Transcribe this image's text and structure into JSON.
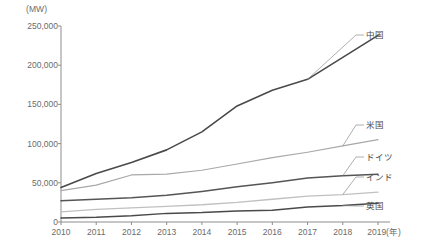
{
  "chart_data": {
    "type": "line",
    "title": "",
    "xlabel": "(年)",
    "ylabel": "(MW)",
    "unit_label": "(MW)",
    "x": [
      2010,
      2011,
      2012,
      2013,
      2014,
      2015,
      2016,
      2017,
      2018,
      2019
    ],
    "xtick_labels": [
      "2010",
      "2011",
      "2012",
      "2013",
      "2014",
      "2015",
      "2016",
      "2017",
      "2018",
      "2019"
    ],
    "xaxis_suffix": "(年)",
    "ytick_labels": [
      "0",
      "50,000",
      "100,000",
      "150,000",
      "200,000",
      "250,000"
    ],
    "ytick_values": [
      0,
      50000,
      100000,
      150000,
      200000,
      250000
    ],
    "ylim": [
      0,
      250000
    ],
    "xlim": [
      2010,
      2019
    ],
    "grid": false,
    "legend_position": "right-callout-labels",
    "series": [
      {
        "name": "中国",
        "color": "#4a4a4a",
        "width": 1.6,
        "label_x": 366,
        "label_y": 36,
        "values": [
          44000,
          62000,
          76000,
          92000,
          115000,
          148000,
          168000,
          182000,
          210000,
          238000
        ]
      },
      {
        "name": "米国",
        "color": "#a8a8a8",
        "width": 1.2,
        "label_x": 366,
        "label_y": 126,
        "values": [
          40000,
          47000,
          60000,
          61000,
          66000,
          74000,
          82000,
          89000,
          97000,
          105000
        ]
      },
      {
        "name": "ドイツ",
        "color": "#555555",
        "width": 1.5,
        "label_x": 366,
        "label_y": 158,
        "values": [
          27000,
          29000,
          31000,
          34000,
          39000,
          45000,
          50000,
          56000,
          59000,
          61000
        ]
      },
      {
        "name": "インド",
        "color": "#c0c0c0",
        "width": 1.3,
        "label_x": 366,
        "label_y": 178,
        "values": [
          13000,
          16000,
          18000,
          20000,
          22000,
          25000,
          29000,
          33000,
          35000,
          38000
        ]
      },
      {
        "name": "英国",
        "color": "#4a4a4a",
        "width": 1.5,
        "label_x": 366,
        "label_y": 207,
        "values": [
          5000,
          6000,
          8000,
          11000,
          12000,
          14000,
          15000,
          19000,
          21000,
          24000
        ]
      }
    ]
  }
}
